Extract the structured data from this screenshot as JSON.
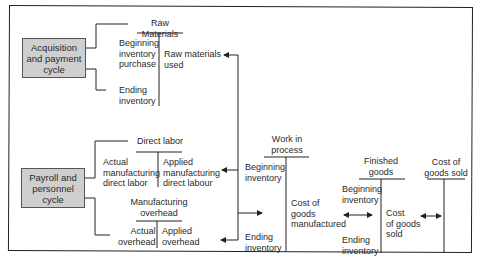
{
  "cycles": {
    "acquisition": "Acquisition\nand payment\ncycle",
    "payroll": "Payroll and\npersonnel\ncycle"
  },
  "accounts": {
    "raw_materials": {
      "title": "Raw Materials",
      "debit": "Beginning\ninventory\npurchase",
      "debit_end": "Ending\ninventory",
      "credit": "Raw materials\nused"
    },
    "direct_labor": {
      "title": "Direct labor",
      "debit": "Actual\nmanufacturing\ndirect labor",
      "credit": "Applied\nmanufacturing\ndirect labour"
    },
    "manufacturing_overhead": {
      "title": "Manufacturing\noverhead",
      "debit": "Actual\noverhead",
      "credit": "Applied\noverhead"
    },
    "work_in_process": {
      "title": "Work in\nprocess",
      "debit": "Beginning\ninventory",
      "debit_end": "Ending\ninventory",
      "credit": "Cost of\ngoods\nmanufactured"
    },
    "finished_goods": {
      "title": "Finished\ngoods",
      "debit": "Beginning\ninventory",
      "debit_end": "Ending\ninventory",
      "credit": "Cost\nof goods\nsold"
    },
    "cost_of_goods_sold": {
      "title": "Cost of\ngoods sold"
    }
  }
}
